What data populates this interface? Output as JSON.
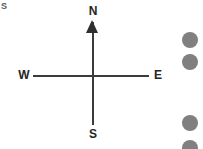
{
  "canvas": {
    "width": 203,
    "height": 149,
    "background_color": "#ffffff"
  },
  "corner_glyph": {
    "text": "S",
    "color": "#555a5e"
  },
  "compass": {
    "name": "compass-rose",
    "line_color": "#3b3b3b",
    "arrow_color": "#2f2f2f",
    "label_color": "#242424",
    "center": {
      "x": 92,
      "y": 76
    },
    "directions": [
      {
        "key": "north",
        "label": "N"
      },
      {
        "key": "west",
        "label": "W"
      },
      {
        "key": "east",
        "label": "E"
      },
      {
        "key": "south",
        "label": "S"
      }
    ]
  },
  "markers": {
    "color": "#808080",
    "diameter": 16,
    "dots": [
      {
        "id": "dot-1",
        "x": 182,
        "y": 32
      },
      {
        "id": "dot-2",
        "x": 182,
        "y": 54
      },
      {
        "id": "dot-3",
        "x": 182,
        "y": 115
      },
      {
        "id": "dot-4",
        "x": 182,
        "y": 140
      }
    ]
  }
}
